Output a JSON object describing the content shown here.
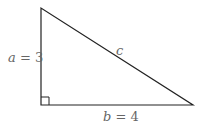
{
  "diagram": {
    "type": "right-triangle",
    "labels": {
      "a_var": "a",
      "a_eq": " = 3",
      "b_var": "b",
      "b_eq": " = 4",
      "c_var": "c"
    },
    "colors": {
      "stroke": "#222222",
      "label": "#666666"
    }
  }
}
